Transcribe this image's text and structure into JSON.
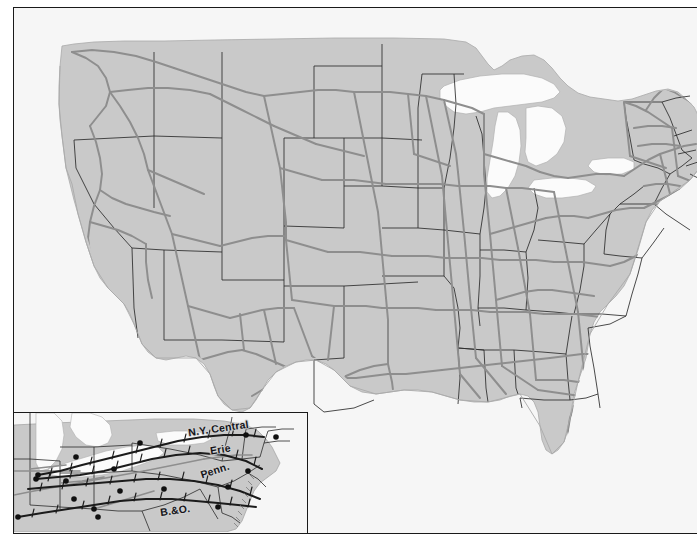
{
  "figure": {
    "kind": "map",
    "background_color": "#ffffff"
  },
  "colors": {
    "ocean": "#f6f6f6",
    "land": "#c9c9c9",
    "land_shadow": "#bdbdbd",
    "lake": "#fbfbfb",
    "rail_secondary": "#8e8e8e",
    "rail_trunk": "#1b1b1b",
    "state_border": "#2a2a2a",
    "frame_border": "#1a1a1a",
    "city_dot": "#101010",
    "label_text": "#15151a"
  },
  "main_map": {
    "name": "united-states-railroad-network",
    "frame": {
      "x": 13,
      "y": 7,
      "width": 684,
      "height": 527
    },
    "features": [
      "coastline",
      "state-borders",
      "great-lakes",
      "railroad-lines"
    ]
  },
  "inset_map": {
    "name": "northeast-trunk-lines-inset",
    "frame": {
      "x": 13,
      "y": 412,
      "width": 295,
      "height": 122
    },
    "labels": [
      {
        "id": "nyc",
        "text": "N.Y. Central",
        "x": 188,
        "y": 422,
        "rotation": -8
      },
      {
        "id": "erie",
        "text": "Erie",
        "x": 210,
        "y": 443,
        "rotation": -9
      },
      {
        "id": "penn",
        "text": "Penn.",
        "x": 200,
        "y": 464,
        "rotation": -18
      },
      {
        "id": "bo",
        "text": "B.&O.",
        "x": 160,
        "y": 504,
        "rotation": -8
      }
    ],
    "railroads": [
      "N.Y. Central",
      "Erie",
      "Penn.",
      "B.&O."
    ],
    "city_dots_count": 16
  }
}
